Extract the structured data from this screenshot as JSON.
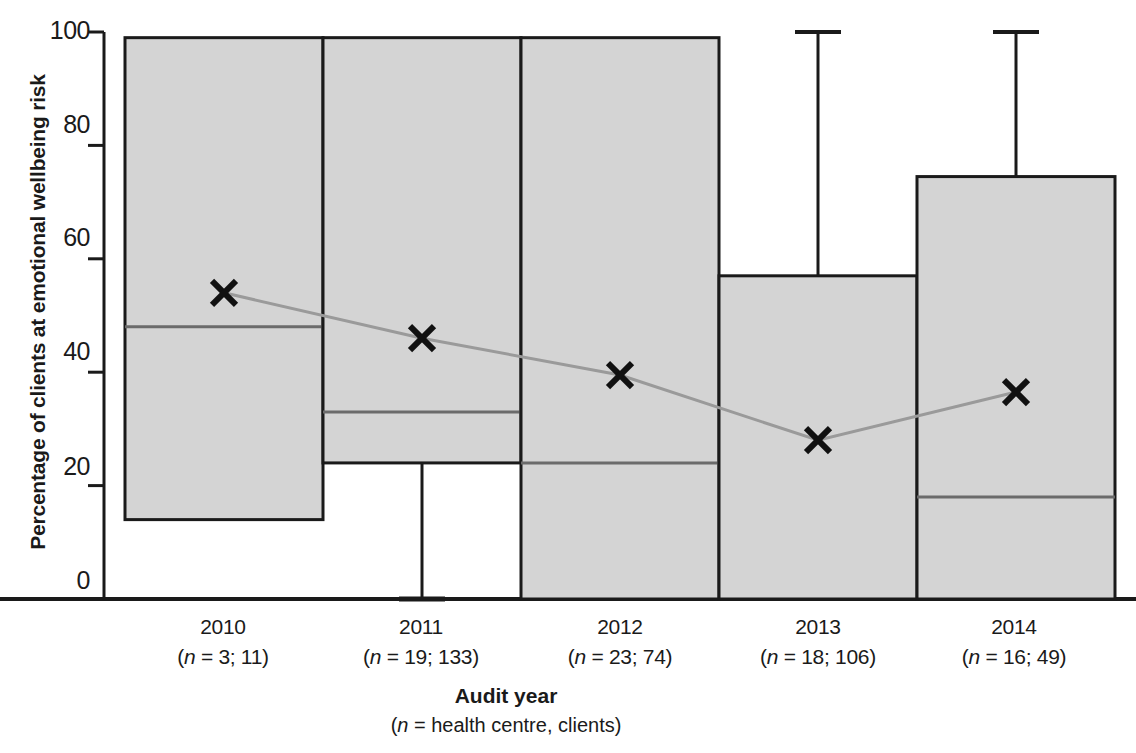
{
  "chart_data": {
    "type": "bar",
    "title": "",
    "xlabel": "Audit year",
    "xlabel_note": "(n = health centre, clients)",
    "ylabel": "Percentage of clients at emotional wellbeing risk",
    "ylim": [
      0,
      100
    ],
    "yticks": [
      0,
      20,
      40,
      60,
      80,
      100
    ],
    "ytick_labels": [
      "0",
      "20",
      "40",
      "60",
      "80",
      "100"
    ],
    "grid": false,
    "legend": false,
    "categories": [
      "2010",
      "2011",
      "2012",
      "2013",
      "2014"
    ],
    "category_notes": [
      "(n = 3; 11)",
      "(n = 19; 133)",
      "(n = 23; 74)",
      "(n = 18; 106)",
      "(n = 16; 49)"
    ],
    "boxes": [
      {
        "year": "2010",
        "q1": 14,
        "q3": 99,
        "median": 48,
        "whisker_low": 14,
        "whisker_high": 99,
        "mean": 54
      },
      {
        "year": "2011",
        "q1": 24,
        "q3": 99,
        "median": 33,
        "whisker_low": 0,
        "whisker_high": 99,
        "mean": 46
      },
      {
        "year": "2012",
        "q1": 0,
        "q3": 99,
        "median": 24,
        "whisker_low": 0,
        "whisker_high": 99,
        "mean": 39.5
      },
      {
        "year": "2013",
        "q1": 0,
        "q3": 57,
        "median": 0,
        "whisker_low": 0,
        "whisker_high": 100,
        "mean": 28
      },
      {
        "year": "2014",
        "q1": 0,
        "q3": 74.5,
        "median": 18,
        "whisker_low": 0,
        "whisker_high": 100,
        "mean": 36.5
      }
    ],
    "series": [
      {
        "name": "mean",
        "marker": "x",
        "values": [
          54,
          46,
          39.5,
          28,
          36.5
        ]
      }
    ],
    "colors": {
      "box_fill": "#d4d4d4",
      "box_stroke": "#1a1a1a",
      "median_line": "#6b6b6b",
      "mean_line": "#9a9a9a",
      "mean_marker": "#111111",
      "axis": "#1a1a1a"
    }
  },
  "axis": {
    "y_label": "Percentage of clients at emotional wellbeing risk",
    "x_title": "Audit year",
    "x_subtitle_prefix": "(",
    "x_subtitle_italic": "n",
    "x_subtitle_rest": " = health centre, clients)"
  }
}
